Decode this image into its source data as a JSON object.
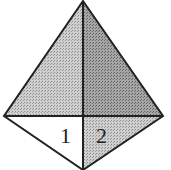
{
  "diagram": {
    "type": "kite-divided-regions",
    "vertices": {
      "top": [
        83,
        1
      ],
      "left": [
        4,
        116
      ],
      "right": [
        163,
        116
      ],
      "bottom": [
        83,
        170
      ]
    },
    "regions": [
      {
        "name": "upper-left",
        "fill": "#bdbdbd"
      },
      {
        "name": "upper-right",
        "fill": "#8f8f8f"
      },
      {
        "name": "lower-left",
        "label": "1",
        "fill": "#ffffff"
      },
      {
        "name": "lower-right",
        "label": "2",
        "fill": "#c4c4c4"
      }
    ],
    "labels": [
      "1",
      "2"
    ]
  }
}
